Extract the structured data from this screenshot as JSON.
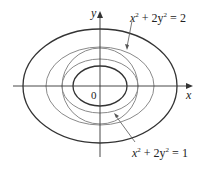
{
  "figure": {
    "origin_label": "0",
    "x_axis_label": "x",
    "y_axis_label": "y",
    "label_upper": {
      "base": "x",
      "sup1": "2",
      "mid": " + 2y",
      "sup2": "2",
      "tail": " = 2"
    },
    "label_lower": {
      "base": "x",
      "sup1": "2",
      "mid": " + 2y",
      "sup2": "2",
      "tail": " = 1"
    },
    "curves": [
      {
        "name": "outer-level-curve",
        "rx": 77,
        "ry": 57,
        "color": "#333333"
      },
      {
        "name": "ellipse-x2-2y2-eq-2",
        "rx": 54,
        "ry": 39,
        "color": "#8a8a8a"
      },
      {
        "name": "circle",
        "rx": 38,
        "ry": 38,
        "color": "#8a8a8a"
      },
      {
        "name": "ellipse-x2-2y2-eq-1",
        "rx": 38,
        "ry": 27,
        "color": "#8a8a8a"
      },
      {
        "name": "inner-level-curve",
        "rx": 27,
        "ry": 20,
        "color": "#333333"
      }
    ]
  }
}
